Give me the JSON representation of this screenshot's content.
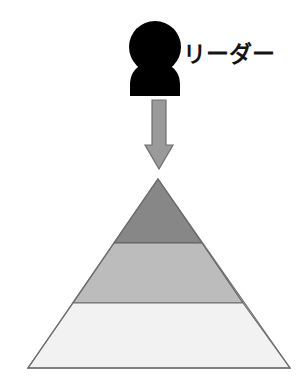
{
  "diagram": {
    "background_color": "#ffffff",
    "actor": {
      "icon_name": "person-silhouette-icon",
      "label": "リーダー",
      "label_color": "#141414",
      "silhouette_color": "#000000"
    },
    "arrow": {
      "icon_name": "arrow-down-icon",
      "direction": "down",
      "fill_color": "#9a9a9a",
      "stroke_color": "#6e6e6e"
    },
    "pyramid": {
      "outline_color": "#6e6e6e",
      "apex": {
        "x": 158,
        "y": 179
      },
      "base_left": {
        "x": 28,
        "y": 368
      },
      "base_right": {
        "x": 290,
        "y": 368
      },
      "layers": [
        {
          "name": "top-layer",
          "fill_color": "#878787",
          "top_y": 179,
          "bottom_y": 243
        },
        {
          "name": "middle-layer",
          "fill_color": "#bcbcbc",
          "top_y": 243,
          "bottom_y": 303
        },
        {
          "name": "bottom-layer",
          "fill_color": "#f2f2f2",
          "top_y": 303,
          "bottom_y": 368
        }
      ],
      "divider_color": "#5a5a5a"
    }
  }
}
